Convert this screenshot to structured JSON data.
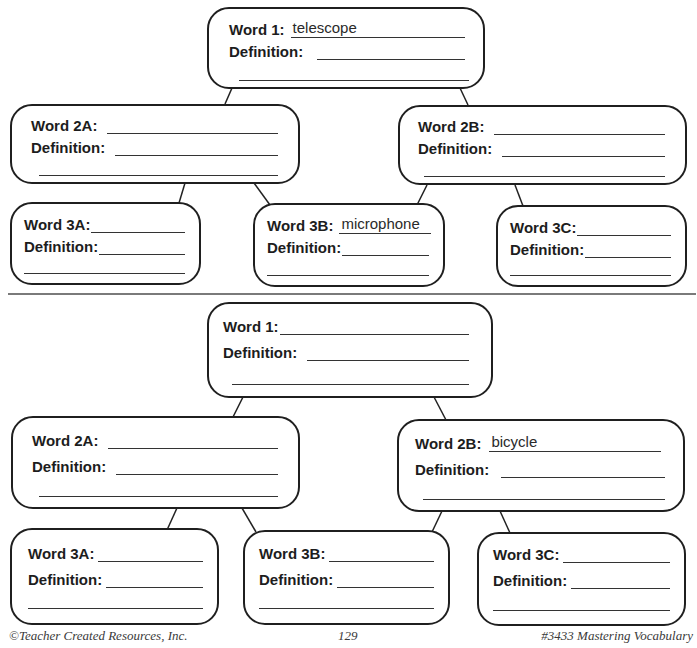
{
  "worksheet": {
    "word_label_suffix": ":",
    "definition_label": "Definition:",
    "organizers": [
      {
        "id": "organizer-1",
        "boxes": {
          "w1": {
            "label": "Word 1:",
            "word": "telescope",
            "definition": ""
          },
          "w2a": {
            "label": "Word 2A:",
            "word": "",
            "definition": ""
          },
          "w2b": {
            "label": "Word 2B:",
            "word": "",
            "definition": ""
          },
          "w3a": {
            "label": "Word 3A:",
            "word": "",
            "definition": ""
          },
          "w3b": {
            "label": "Word 3B:",
            "word": "microphone",
            "definition": ""
          },
          "w3c": {
            "label": "Word 3C:",
            "word": "",
            "definition": ""
          }
        }
      },
      {
        "id": "organizer-2",
        "boxes": {
          "w1": {
            "label": "Word 1:",
            "word": "",
            "definition": ""
          },
          "w2a": {
            "label": "Word 2A:",
            "word": "",
            "definition": ""
          },
          "w2b": {
            "label": "Word 2B:",
            "word": "bicycle",
            "definition": ""
          },
          "w3a": {
            "label": "Word 3A:",
            "word": "",
            "definition": ""
          },
          "w3b": {
            "label": "Word 3B:",
            "word": "",
            "definition": ""
          },
          "w3c": {
            "label": "Word 3C:",
            "word": "",
            "definition": ""
          }
        }
      }
    ]
  },
  "footer": {
    "copyright": "©Teacher Created Resources, Inc.",
    "page_number": "129",
    "book_title": "#3433 Mastering Vocabulary"
  },
  "colors": {
    "ink": "#1f1f1f",
    "divider": "#7a7a7a",
    "paper": "#ffffff"
  }
}
